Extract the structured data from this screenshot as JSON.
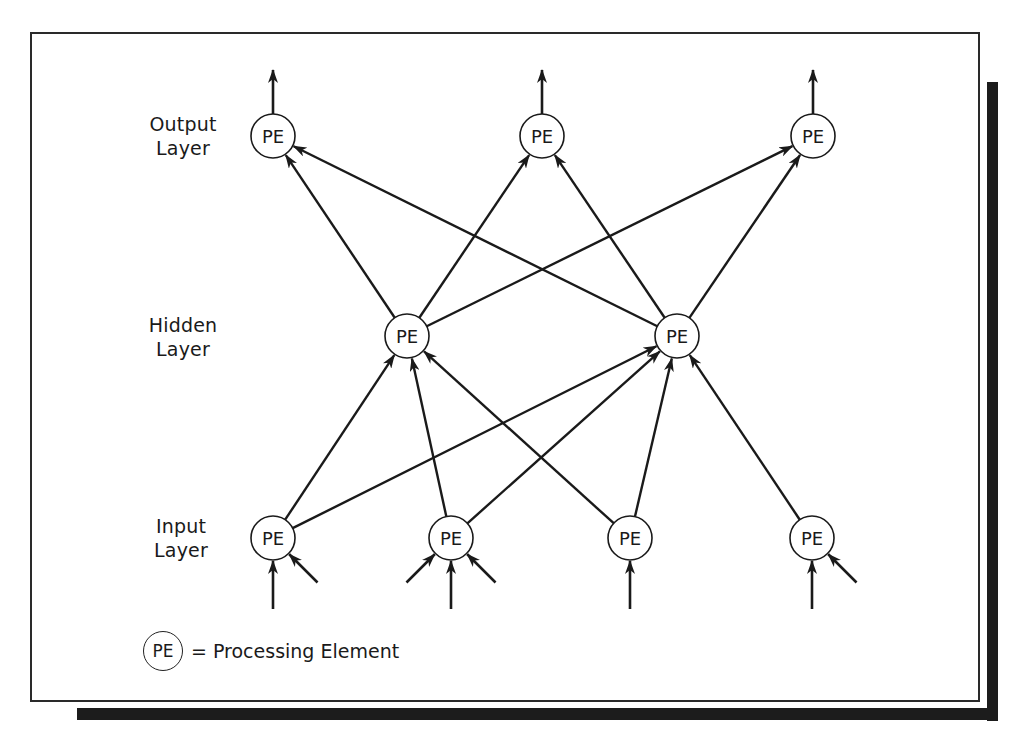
{
  "diagram": {
    "node_label": "PE",
    "layers": [
      {
        "id": "output",
        "label_line1": "Output",
        "label_line2": "Layer"
      },
      {
        "id": "hidden",
        "label_line1": "Hidden",
        "label_line2": "Layer"
      },
      {
        "id": "input",
        "label_line1": "Input",
        "label_line2": "Layer"
      }
    ],
    "nodes": {
      "output": [
        {
          "id": "O1",
          "x": 273,
          "y": 136
        },
        {
          "id": "O2",
          "x": 542,
          "y": 136
        },
        {
          "id": "O3",
          "x": 813,
          "y": 136
        }
      ],
      "hidden": [
        {
          "id": "H1",
          "x": 407,
          "y": 336
        },
        {
          "id": "H2",
          "x": 677,
          "y": 336
        }
      ],
      "input": [
        {
          "id": "I1",
          "x": 273,
          "y": 538
        },
        {
          "id": "I2",
          "x": 451,
          "y": 538
        },
        {
          "id": "I3",
          "x": 630,
          "y": 538
        },
        {
          "id": "I4",
          "x": 812,
          "y": 538
        }
      ]
    },
    "edges": [
      {
        "from": "I1",
        "to": "H1"
      },
      {
        "from": "I2",
        "to": "H1"
      },
      {
        "from": "I3",
        "to": "H1"
      },
      {
        "from": "I1",
        "to": "H2"
      },
      {
        "from": "I2",
        "to": "H2"
      },
      {
        "from": "I3",
        "to": "H2"
      },
      {
        "from": "I4",
        "to": "H2"
      },
      {
        "from": "H1",
        "to": "O1"
      },
      {
        "from": "H2",
        "to": "O1"
      },
      {
        "from": "H1",
        "to": "O2"
      },
      {
        "from": "H2",
        "to": "O2"
      },
      {
        "from": "H1",
        "to": "O3"
      },
      {
        "from": "H2",
        "to": "O3"
      }
    ],
    "output_arrows": [
      "O1",
      "O2",
      "O3"
    ],
    "input_arrows": [
      {
        "to": "I1",
        "directions": [
          "up",
          "from-lower-right"
        ]
      },
      {
        "to": "I2",
        "directions": [
          "from-lower-left",
          "up",
          "from-lower-right"
        ]
      },
      {
        "to": "I3",
        "directions": [
          "up"
        ]
      },
      {
        "to": "I4",
        "directions": [
          "up",
          "from-lower-right"
        ]
      }
    ]
  },
  "legend": {
    "symbol_label": "PE",
    "text": "= Processing Element"
  },
  "colors": {
    "line": "#1a1a1a",
    "frame": "#2a2a2a",
    "shadow": "#1c1c1c",
    "background": "#ffffff"
  }
}
